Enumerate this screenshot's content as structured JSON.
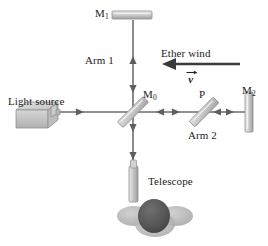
{
  "figure": {
    "background_color": "#ffffff",
    "beam_color": "#6a6a6a",
    "optic_fill": "#c9c9c9",
    "optic_stroke": "#8a8a8a",
    "head_color": "#595959",
    "shoulder_color": "#b5b5b5",
    "source_color": "#c2c2c2"
  },
  "labels": {
    "mirror_1": "M",
    "mirror_1_sub": "1",
    "mirror_0": "M",
    "mirror_0_sub": "0",
    "mirror_2": "M",
    "mirror_2_sub": "2",
    "plate": "P",
    "arm_1": "Arm 1",
    "arm_2": "Arm 2",
    "ether_wind": "Ether wind",
    "velocity": "v",
    "light_source": "Light source",
    "telescope": "Telescope"
  },
  "components": [
    {
      "name": "light-source",
      "label": "Light source",
      "x": 30,
      "y": 117
    },
    {
      "name": "beam-splitter",
      "label": "M0",
      "x": 133,
      "y": 112
    },
    {
      "name": "mirror-1",
      "label": "M1",
      "x": 133,
      "y": 16
    },
    {
      "name": "compensator-plate",
      "label": "P",
      "x": 204,
      "y": 112
    },
    {
      "name": "mirror-2",
      "label": "M2",
      "x": 249,
      "y": 112
    },
    {
      "name": "telescope",
      "label": "Telescope",
      "x": 136,
      "y": 185
    },
    {
      "name": "observer-head",
      "label": "Observer",
      "x": 155,
      "y": 217
    }
  ],
  "beams": [
    {
      "name": "source-to-splitter",
      "from": [
        46,
        112
      ],
      "to": [
        133,
        112
      ],
      "direction": "right"
    },
    {
      "name": "splitter-to-mirror1",
      "from": [
        133,
        112
      ],
      "to": [
        133,
        22
      ],
      "direction": "up-and-down"
    },
    {
      "name": "splitter-to-mirror2",
      "from": [
        133,
        112
      ],
      "to": [
        245,
        112
      ],
      "direction": "right-and-left"
    },
    {
      "name": "splitter-to-telescope",
      "from": [
        133,
        112
      ],
      "to": [
        133,
        186
      ],
      "direction": "down"
    }
  ],
  "ether_wind_arrow": {
    "name": "ether-wind-arrow",
    "from": [
      240,
      64
    ],
    "to": [
      165,
      64
    ],
    "direction": "left"
  }
}
